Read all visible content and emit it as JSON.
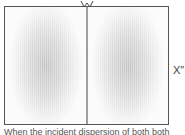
{
  "figure": {
    "side_label": "X″",
    "caption": "When the incident dispersion of both both",
    "colors": {
      "frame": "#555555",
      "divider": "#444444",
      "pattern_center": "#c4c4c4",
      "pattern_edge": "#fafafa"
    },
    "panels": [
      {
        "position": "left"
      },
      {
        "position": "right"
      }
    ]
  }
}
